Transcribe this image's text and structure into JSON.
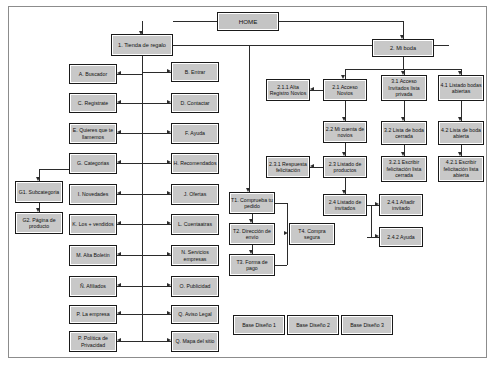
{
  "diagram": {
    "colors": {
      "node_fill": "#c8c8c8",
      "node_border": "#1a1a1a",
      "line": "#2b2b2b",
      "frame": "#8c8c8c",
      "background": "#ffffff"
    },
    "nodes": [
      {
        "id": "home",
        "label": "HOME",
        "x": 216,
        "y": 11,
        "w": 62,
        "h": 19,
        "cls": "home"
      },
      {
        "id": "n1",
        "label": "1. Tienda de regalo",
        "x": 110,
        "y": 33,
        "w": 62,
        "h": 22,
        "cls": "lvl1"
      },
      {
        "id": "n2",
        "label": "2. Mi boda",
        "x": 371,
        "y": 38,
        "w": 62,
        "h": 18,
        "cls": "lvl1"
      },
      {
        "id": "a",
        "label": "A. Buscador",
        "x": 68,
        "y": 63,
        "w": 48,
        "h": 20,
        "cls": ""
      },
      {
        "id": "b",
        "label": "B. Entrar",
        "x": 170,
        "y": 61,
        "w": 48,
        "h": 20,
        "cls": ""
      },
      {
        "id": "c",
        "label": "C. Registrate",
        "x": 68,
        "y": 92,
        "w": 48,
        "h": 20,
        "cls": ""
      },
      {
        "id": "d",
        "label": "D. Contactar",
        "x": 170,
        "y": 92,
        "w": 48,
        "h": 20,
        "cls": ""
      },
      {
        "id": "e",
        "label": "E. Quieres que te llamemos",
        "x": 68,
        "y": 122,
        "w": 48,
        "h": 21,
        "cls": ""
      },
      {
        "id": "f",
        "label": "F. Ayuda",
        "x": 170,
        "y": 122,
        "w": 48,
        "h": 21,
        "cls": ""
      },
      {
        "id": "g",
        "label": "G. Categorias",
        "x": 68,
        "y": 152,
        "w": 48,
        "h": 21,
        "cls": ""
      },
      {
        "id": "h",
        "label": "H. Recomendados",
        "x": 170,
        "y": 152,
        "w": 48,
        "h": 21,
        "cls": ""
      },
      {
        "id": "i",
        "label": "I. Novedades",
        "x": 68,
        "y": 183,
        "w": 48,
        "h": 21,
        "cls": ""
      },
      {
        "id": "j",
        "label": "J. Ofertas",
        "x": 170,
        "y": 183,
        "w": 48,
        "h": 21,
        "cls": ""
      },
      {
        "id": "k",
        "label": "K. Los + vendidos",
        "x": 68,
        "y": 213,
        "w": 48,
        "h": 21,
        "cls": ""
      },
      {
        "id": "l",
        "label": "L. Cuentaatras",
        "x": 170,
        "y": 213,
        "w": 48,
        "h": 21,
        "cls": ""
      },
      {
        "id": "m",
        "label": "M. Alta Boletín",
        "x": 68,
        "y": 244,
        "w": 48,
        "h": 21,
        "cls": ""
      },
      {
        "id": "n",
        "label": "N. Servicios empresas",
        "x": 170,
        "y": 244,
        "w": 48,
        "h": 21,
        "cls": ""
      },
      {
        "id": "enye",
        "label": "Ñ. Afiliados",
        "x": 68,
        "y": 275,
        "w": 48,
        "h": 21,
        "cls": ""
      },
      {
        "id": "o",
        "label": "O. Publicidad",
        "x": 170,
        "y": 275,
        "w": 48,
        "h": 21,
        "cls": ""
      },
      {
        "id": "p",
        "label": "P. La empresa",
        "x": 68,
        "y": 304,
        "w": 48,
        "h": 19,
        "cls": ""
      },
      {
        "id": "q",
        "label": "Q. Aviso Legal",
        "x": 170,
        "y": 304,
        "w": 48,
        "h": 19,
        "cls": ""
      },
      {
        "id": "pp",
        "label": "P. Política de Privacidad",
        "x": 68,
        "y": 330,
        "w": 48,
        "h": 21,
        "cls": ""
      },
      {
        "id": "qm",
        "label": "Q. Mapa del sitio",
        "x": 170,
        "y": 330,
        "w": 48,
        "h": 21,
        "cls": ""
      },
      {
        "id": "g1",
        "label": "G1. Subcategoria",
        "x": 14,
        "y": 180,
        "w": 48,
        "h": 22,
        "cls": ""
      },
      {
        "id": "g2",
        "label": "G2. Página de producto",
        "x": 14,
        "y": 211,
        "w": 48,
        "h": 22,
        "cls": ""
      },
      {
        "id": "t1",
        "label": "T1. Comprueba tu pedido",
        "x": 228,
        "y": 191,
        "w": 46,
        "h": 22,
        "cls": ""
      },
      {
        "id": "t2",
        "label": "T2. Dirección de envío",
        "x": 228,
        "y": 222,
        "w": 46,
        "h": 22,
        "cls": ""
      },
      {
        "id": "t3",
        "label": "T3. Forma de pago",
        "x": 228,
        "y": 253,
        "w": 46,
        "h": 22,
        "cls": ""
      },
      {
        "id": "t4",
        "label": "T4. Compra segura",
        "x": 288,
        "y": 222,
        "w": 46,
        "h": 22,
        "cls": ""
      },
      {
        "id": "n211",
        "label": "2.1.1 Alta Registro Novios",
        "x": 265,
        "y": 78,
        "w": 44,
        "h": 22,
        "cls": ""
      },
      {
        "id": "n21",
        "label": "2.1 Acceso Novios",
        "x": 322,
        "y": 78,
        "w": 44,
        "h": 22,
        "cls": ""
      },
      {
        "id": "n22",
        "label": "2.2 Mi cuenta de novios",
        "x": 322,
        "y": 120,
        "w": 44,
        "h": 22,
        "cls": ""
      },
      {
        "id": "n231",
        "label": "2.3.1 Respuesta felicitación",
        "x": 265,
        "y": 155,
        "w": 44,
        "h": 22,
        "cls": ""
      },
      {
        "id": "n23",
        "label": "2.3 Listado de productos",
        "x": 322,
        "y": 155,
        "w": 44,
        "h": 22,
        "cls": ""
      },
      {
        "id": "n24",
        "label": "2.4 Listado de invitados",
        "x": 322,
        "y": 193,
        "w": 44,
        "h": 22,
        "cls": ""
      },
      {
        "id": "n241",
        "label": "2.4.1 Añadir invitado",
        "x": 378,
        "y": 193,
        "w": 44,
        "h": 22,
        "cls": ""
      },
      {
        "id": "n242",
        "label": "2.4.2 Ayuda",
        "x": 378,
        "y": 226,
        "w": 44,
        "h": 20,
        "cls": ""
      },
      {
        "id": "n31",
        "label": "3.1 Acceso Invitados lista privada",
        "x": 380,
        "y": 74,
        "w": 46,
        "h": 26,
        "cls": ""
      },
      {
        "id": "n32",
        "label": "3.2 Lista de boda cerrada",
        "x": 380,
        "y": 120,
        "w": 46,
        "h": 24,
        "cls": ""
      },
      {
        "id": "n321",
        "label": "3.2.1 Escribir felicitación lista cerrada",
        "x": 380,
        "y": 155,
        "w": 46,
        "h": 26,
        "cls": ""
      },
      {
        "id": "n41",
        "label": "4.1 Listado bodas abiertas",
        "x": 437,
        "y": 74,
        "w": 46,
        "h": 26,
        "cls": ""
      },
      {
        "id": "n42",
        "label": "4.2 Lista de boda abierta",
        "x": 437,
        "y": 120,
        "w": 46,
        "h": 24,
        "cls": ""
      },
      {
        "id": "n421",
        "label": "4.2.1 Escribir felicitación lista abierta",
        "x": 437,
        "y": 155,
        "w": 46,
        "h": 26,
        "cls": ""
      },
      {
        "id": "bd1",
        "label": "Base Diseño 1",
        "x": 232,
        "y": 314,
        "w": 52,
        "h": 20,
        "cls": ""
      },
      {
        "id": "bd2",
        "label": "Base Diseño 2",
        "x": 286,
        "y": 314,
        "w": 52,
        "h": 20,
        "cls": ""
      },
      {
        "id": "bd3",
        "label": "Base Diseño 3",
        "x": 340,
        "y": 314,
        "w": 52,
        "h": 20,
        "cls": ""
      }
    ],
    "lines": [
      {
        "t": "h",
        "x": 172,
        "y": 20,
        "w": 44
      },
      {
        "t": "h",
        "x": 278,
        "y": 20,
        "w": 124
      },
      {
        "t": "v",
        "x": 141,
        "y": 20,
        "h": 13
      },
      {
        "t": "v",
        "x": 402,
        "y": 20,
        "h": 18
      },
      {
        "t": "v",
        "x": 141,
        "y": 55,
        "h": 286
      },
      {
        "t": "h",
        "x": 172,
        "y": 44,
        "w": 276
      },
      {
        "t": "v",
        "x": 248,
        "y": 44,
        "h": 147
      },
      {
        "t": "v",
        "x": 402,
        "y": 56,
        "h": 12
      },
      {
        "t": "h",
        "x": 344,
        "y": 68,
        "w": 116
      },
      {
        "t": "v",
        "x": 344,
        "y": 68,
        "h": 10
      },
      {
        "t": "v",
        "x": 403,
        "y": 68,
        "h": 6
      },
      {
        "t": "v",
        "x": 460,
        "y": 68,
        "h": 6
      },
      {
        "t": "h",
        "x": 116,
        "y": 73,
        "w": 25
      },
      {
        "t": "h",
        "x": 141,
        "y": 71,
        "w": 29
      },
      {
        "t": "h",
        "x": 116,
        "y": 102,
        "w": 25
      },
      {
        "t": "h",
        "x": 141,
        "y": 102,
        "w": 29
      },
      {
        "t": "h",
        "x": 116,
        "y": 132,
        "w": 25
      },
      {
        "t": "h",
        "x": 141,
        "y": 132,
        "w": 29
      },
      {
        "t": "h",
        "x": 116,
        "y": 162,
        "w": 25
      },
      {
        "t": "h",
        "x": 141,
        "y": 162,
        "w": 29
      },
      {
        "t": "h",
        "x": 116,
        "y": 193,
        "w": 25
      },
      {
        "t": "h",
        "x": 141,
        "y": 193,
        "w": 29
      },
      {
        "t": "h",
        "x": 116,
        "y": 223,
        "w": 25
      },
      {
        "t": "h",
        "x": 141,
        "y": 223,
        "w": 29
      },
      {
        "t": "h",
        "x": 116,
        "y": 254,
        "w": 25
      },
      {
        "t": "h",
        "x": 141,
        "y": 254,
        "w": 29
      },
      {
        "t": "h",
        "x": 116,
        "y": 285,
        "w": 25
      },
      {
        "t": "h",
        "x": 141,
        "y": 285,
        "w": 29
      },
      {
        "t": "h",
        "x": 116,
        "y": 313,
        "w": 25
      },
      {
        "t": "h",
        "x": 141,
        "y": 313,
        "w": 29
      },
      {
        "t": "h",
        "x": 116,
        "y": 340,
        "w": 25
      },
      {
        "t": "h",
        "x": 141,
        "y": 340,
        "w": 29
      },
      {
        "t": "h",
        "x": 38,
        "y": 168,
        "w": 30
      },
      {
        "t": "v",
        "x": 38,
        "y": 168,
        "h": 12
      },
      {
        "t": "v",
        "x": 38,
        "y": 202,
        "h": 9
      },
      {
        "t": "v",
        "x": 251,
        "y": 213,
        "h": 9
      },
      {
        "t": "v",
        "x": 251,
        "y": 244,
        "h": 9
      },
      {
        "t": "h",
        "x": 274,
        "y": 202,
        "w": 12
      },
      {
        "t": "v",
        "x": 286,
        "y": 202,
        "h": 31
      },
      {
        "t": "h",
        "x": 274,
        "y": 264,
        "w": 12
      },
      {
        "t": "v",
        "x": 286,
        "y": 233,
        "h": 31
      },
      {
        "t": "h",
        "x": 309,
        "y": 89,
        "w": 13
      },
      {
        "t": "v",
        "x": 344,
        "y": 100,
        "h": 20
      },
      {
        "t": "v",
        "x": 344,
        "y": 142,
        "h": 13
      },
      {
        "t": "h",
        "x": 309,
        "y": 166,
        "w": 13
      },
      {
        "t": "v",
        "x": 344,
        "y": 177,
        "h": 16
      },
      {
        "t": "h",
        "x": 366,
        "y": 204,
        "w": 12
      },
      {
        "t": "h",
        "x": 366,
        "y": 236,
        "w": 12
      },
      {
        "t": "v",
        "x": 370,
        "y": 204,
        "h": 32
      },
      {
        "t": "v",
        "x": 403,
        "y": 100,
        "h": 20
      },
      {
        "t": "v",
        "x": 403,
        "y": 144,
        "h": 11
      },
      {
        "t": "v",
        "x": 460,
        "y": 100,
        "h": 20
      },
      {
        "t": "v",
        "x": 460,
        "y": 144,
        "h": 11
      }
    ],
    "arrows": [
      {
        "dir": "d",
        "x": 216,
        "y": 16
      },
      {
        "dir": "d",
        "x": 138,
        "y": 30
      },
      {
        "dir": "d",
        "x": 399,
        "y": 34
      },
      {
        "dir": "l",
        "x": 116,
        "y": 70
      },
      {
        "dir": "r",
        "x": 166,
        "y": 68
      },
      {
        "dir": "l",
        "x": 116,
        "y": 99
      },
      {
        "dir": "r",
        "x": 166,
        "y": 99
      },
      {
        "dir": "l",
        "x": 116,
        "y": 129
      },
      {
        "dir": "r",
        "x": 166,
        "y": 129
      },
      {
        "dir": "l",
        "x": 116,
        "y": 159
      },
      {
        "dir": "r",
        "x": 166,
        "y": 159
      },
      {
        "dir": "l",
        "x": 116,
        "y": 190
      },
      {
        "dir": "r",
        "x": 166,
        "y": 190
      },
      {
        "dir": "l",
        "x": 116,
        "y": 220
      },
      {
        "dir": "r",
        "x": 166,
        "y": 220
      },
      {
        "dir": "l",
        "x": 116,
        "y": 251
      },
      {
        "dir": "r",
        "x": 166,
        "y": 251
      },
      {
        "dir": "l",
        "x": 116,
        "y": 282
      },
      {
        "dir": "r",
        "x": 166,
        "y": 282
      },
      {
        "dir": "l",
        "x": 116,
        "y": 310
      },
      {
        "dir": "r",
        "x": 166,
        "y": 310
      },
      {
        "dir": "l",
        "x": 116,
        "y": 337
      },
      {
        "dir": "r",
        "x": 166,
        "y": 337
      },
      {
        "dir": "d",
        "x": 35,
        "y": 176
      },
      {
        "dir": "d",
        "x": 35,
        "y": 207
      },
      {
        "dir": "d",
        "x": 245,
        "y": 187
      },
      {
        "dir": "d",
        "x": 248,
        "y": 218
      },
      {
        "dir": "d",
        "x": 248,
        "y": 249
      },
      {
        "dir": "r",
        "x": 283,
        "y": 230
      },
      {
        "dir": "l",
        "x": 309,
        "y": 86
      },
      {
        "dir": "d",
        "x": 341,
        "y": 116
      },
      {
        "dir": "d",
        "x": 341,
        "y": 151
      },
      {
        "dir": "l",
        "x": 309,
        "y": 163
      },
      {
        "dir": "d",
        "x": 341,
        "y": 189
      },
      {
        "dir": "r",
        "x": 374,
        "y": 201
      },
      {
        "dir": "r",
        "x": 374,
        "y": 233
      },
      {
        "dir": "d",
        "x": 340,
        "y": 74
      },
      {
        "dir": "d",
        "x": 400,
        "y": 70
      },
      {
        "dir": "d",
        "x": 457,
        "y": 70
      },
      {
        "dir": "d",
        "x": 400,
        "y": 116
      },
      {
        "dir": "d",
        "x": 457,
        "y": 116
      },
      {
        "dir": "d",
        "x": 400,
        "y": 151
      },
      {
        "dir": "d",
        "x": 457,
        "y": 151
      }
    ]
  }
}
